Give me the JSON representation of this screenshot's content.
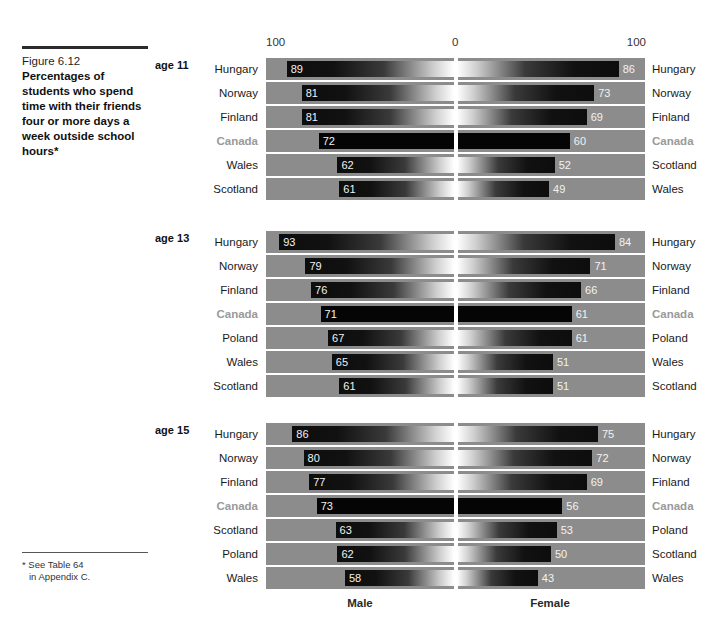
{
  "figure": {
    "number": "Figure 6.12",
    "title": "Percentages of students who spend time with their friends four or more days a week outside school hours*"
  },
  "footnote": {
    "line1": "* See Table 64",
    "line2": "in Appendix C."
  },
  "scale": {
    "left": "100",
    "center": "0",
    "right": "100"
  },
  "sex_labels": {
    "male": "Male",
    "female": "Female"
  },
  "colors": {
    "band_background": "#8c8c8c",
    "bar_dark": "#0d0d0d",
    "bar_light": "#ffffff",
    "highlight_label": "#9a9a9a",
    "center_line": "#ffffff",
    "text": "#1a1a1a"
  },
  "panels": [
    {
      "age_label": "age 11"
    },
    {
      "age_label": "age 13"
    },
    {
      "age_label": "age 15"
    }
  ],
  "chart_data": {
    "type": "bar",
    "title": "Percentages of students who spend time with their friends four or more days a week outside school hours",
    "xlabel": "",
    "ylabel": "",
    "xlim": [
      0,
      100
    ],
    "grid": false,
    "orientation": "horizontal-diverging",
    "legend_position": "bottom",
    "series_names": [
      "Male",
      "Female"
    ],
    "axis_ticks": [
      "100",
      "0",
      "100"
    ],
    "panels": [
      {
        "age_label": "age 11",
        "rows": [
          {
            "left_label": "Hungary",
            "right_label": "Hungary",
            "male": 89,
            "female": 86,
            "highlight": false
          },
          {
            "left_label": "Norway",
            "right_label": "Norway",
            "male": 81,
            "female": 73,
            "highlight": false
          },
          {
            "left_label": "Finland",
            "right_label": "Finland",
            "male": 81,
            "female": 69,
            "highlight": false
          },
          {
            "left_label": "Canada",
            "right_label": "Canada",
            "male": 72,
            "female": 60,
            "highlight": true
          },
          {
            "left_label": "Wales",
            "right_label": "Scotland",
            "male": 62,
            "female": 52,
            "highlight": false
          },
          {
            "left_label": "Scotland",
            "right_label": "Wales",
            "male": 61,
            "female": 49,
            "highlight": false
          }
        ]
      },
      {
        "age_label": "age 13",
        "rows": [
          {
            "left_label": "Hungary",
            "right_label": "Hungary",
            "male": 93,
            "female": 84,
            "highlight": false
          },
          {
            "left_label": "Norway",
            "right_label": "Norway",
            "male": 79,
            "female": 71,
            "highlight": false
          },
          {
            "left_label": "Finland",
            "right_label": "Finland",
            "male": 76,
            "female": 66,
            "highlight": false
          },
          {
            "left_label": "Canada",
            "right_label": "Canada",
            "male": 71,
            "female": 61,
            "highlight": true
          },
          {
            "left_label": "Poland",
            "right_label": "Poland",
            "male": 67,
            "female": 61,
            "highlight": false
          },
          {
            "left_label": "Wales",
            "right_label": "Wales",
            "male": 65,
            "female": 51,
            "highlight": false
          },
          {
            "left_label": "Scotland",
            "right_label": "Scotland",
            "male": 61,
            "female": 51,
            "highlight": false
          }
        ]
      },
      {
        "age_label": "age 15",
        "rows": [
          {
            "left_label": "Hungary",
            "right_label": "Hungary",
            "male": 86,
            "female": 75,
            "highlight": false
          },
          {
            "left_label": "Norway",
            "right_label": "Norway",
            "male": 80,
            "female": 72,
            "highlight": false
          },
          {
            "left_label": "Finland",
            "right_label": "Finland",
            "male": 77,
            "female": 69,
            "highlight": false
          },
          {
            "left_label": "Canada",
            "right_label": "Canada",
            "male": 73,
            "female": 56,
            "highlight": true
          },
          {
            "left_label": "Scotland",
            "right_label": "Poland",
            "male": 63,
            "female": 53,
            "highlight": false
          },
          {
            "left_label": "Poland",
            "right_label": "Scotland",
            "male": 62,
            "female": 50,
            "highlight": false
          },
          {
            "left_label": "Wales",
            "right_label": "Wales",
            "male": 58,
            "female": 43,
            "highlight": false
          }
        ]
      }
    ]
  }
}
